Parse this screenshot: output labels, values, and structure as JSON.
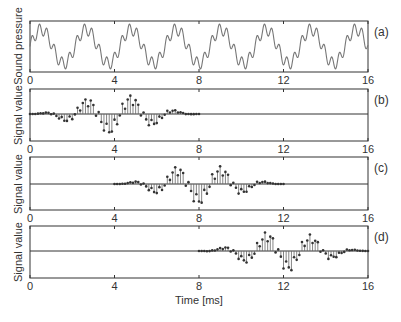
{
  "chart_data": [
    {
      "panel": "(a)",
      "type": "line",
      "ylabel": "Sound pressure",
      "xlabel": "",
      "xlim": [
        0,
        16
      ],
      "xticks": [
        0,
        4,
        8,
        12,
        16
      ],
      "description": "Continuous periodic sound pressure waveform: fundamental period ~2.13 ms with a superimposed higher harmonic ripple",
      "signal": {
        "fundamental_period_ms": 2.13,
        "harmonic_multiple": 6,
        "harmonic_amplitude": 0.35
      }
    },
    {
      "panel": "(b)",
      "type": "stem",
      "ylabel": "Signal value",
      "xlim": [
        0,
        16
      ],
      "xticks": [
        0,
        4,
        8,
        12,
        16
      ],
      "window_ms": [
        0,
        8
      ],
      "samples": 64,
      "description": "Windowed (Hann) sampled segment of the waveform from 0 to 8 ms"
    },
    {
      "panel": "(c)",
      "type": "stem",
      "ylabel": "Signal value",
      "xlim": [
        0,
        16
      ],
      "xticks": [
        0,
        4,
        8,
        12,
        16
      ],
      "window_ms": [
        4,
        12
      ],
      "samples": 64,
      "description": "Windowed (Hann) sampled segment of the waveform from 4 to 12 ms"
    },
    {
      "panel": "(d)",
      "type": "stem",
      "ylabel": "Signal value",
      "xlabel": "Time [ms]",
      "xlim": [
        0,
        16
      ],
      "xticks": [
        0,
        4,
        8,
        12,
        16
      ],
      "window_ms": [
        8,
        16
      ],
      "samples": 64,
      "description": "Windowed (Hann) sampled segment of the waveform from 8 to 16 ms"
    }
  ],
  "labels": {
    "panel_a": "(a)",
    "panel_b": "(b)",
    "panel_c": "(c)",
    "panel_d": "(d)",
    "ylabel_a": "Sound pressure",
    "ylabel_b": "Signal value",
    "ylabel_c": "Signal value",
    "ylabel_d": "Signal value",
    "xlabel": "Time [ms]",
    "tick_0": "0",
    "tick_4": "4",
    "tick_8": "8",
    "tick_12": "12",
    "tick_16": "16"
  },
  "colors": {
    "axis": "#333333",
    "line": "#777777",
    "stem": "#666666",
    "marker": "#333333"
  }
}
